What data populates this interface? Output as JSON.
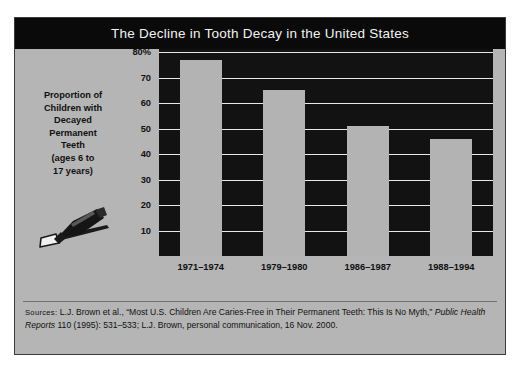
{
  "figure": {
    "title": "The Decline in Tooth Decay in the United States",
    "axis_caption_lines": [
      "Proportion of",
      "Children with",
      "Decayed",
      "Permanent",
      "Teeth",
      "(ages 6 to",
      "17 years)"
    ],
    "icon": "toothbrush-with-toothpaste-icon",
    "source": {
      "label": "Sources:",
      "text_before_italic": " L.J. Brown et al., “Most U.S. Children Are Caries-Free in Their Permanent Teeth: This Is No Myth,” ",
      "italic_title": "Public Health Reports",
      "text_after_italic": " 110 (1995): 531–533; L.J. Brown, personal communication, 16 Nov. 2000."
    },
    "colors": {
      "title_bar": "#0a0a0a",
      "title_text": "#f2f2f2",
      "page_background": "#b5b5b5",
      "plot_background": "#121212",
      "bar_fill": "#b3b3b3",
      "gridline": "#e8e8e8",
      "border": "#3a3a3a"
    }
  },
  "chart_data": {
    "type": "bar",
    "title": "The Decline in Tooth Decay in the United States",
    "xlabel": "",
    "ylabel": "Proportion of Children with Decayed Permanent Teeth (ages 6 to 17 years)",
    "categories": [
      "1971–1974",
      "1979–1980",
      "1986–1987",
      "1988–1994"
    ],
    "values": [
      77,
      65,
      51,
      46
    ],
    "ylim": [
      0,
      80
    ],
    "yticks": [
      10,
      20,
      30,
      40,
      50,
      60,
      70,
      80
    ],
    "ytick_labels": [
      "10",
      "20",
      "30",
      "40",
      "50",
      "60",
      "70",
      "80%"
    ],
    "grid": true,
    "legend": "none",
    "units": "percent"
  }
}
